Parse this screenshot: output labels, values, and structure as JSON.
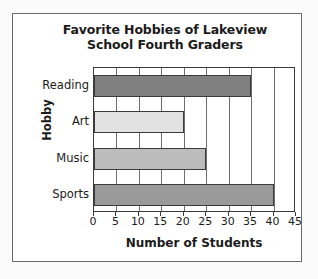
{
  "frame": {
    "background_color": "#fbfbfb",
    "border_color": "#6b6b6b",
    "plot_background": "#ffffff"
  },
  "chart_data": {
    "type": "bar",
    "orientation": "horizontal",
    "title": "Favorite Hobbies of Lakeview School Fourth Graders",
    "title_lines": [
      "Favorite Hobbies of Lakeview",
      "School Fourth Graders"
    ],
    "xlabel": "Number of Students",
    "ylabel": "Hobby",
    "categories": [
      "Reading",
      "Art",
      "Music",
      "Sports"
    ],
    "values": [
      35,
      20,
      25,
      40
    ],
    "bar_colors": [
      "#808080",
      "#e2e2e2",
      "#bcbcbc",
      "#9a9a9a"
    ],
    "bar_border_color": "#3b3b3b",
    "xlim": [
      0,
      45
    ],
    "xticks": [
      0,
      5,
      10,
      15,
      20,
      25,
      30,
      35,
      40,
      45
    ],
    "xtick_labels": [
      "0",
      "5",
      "10",
      "15",
      "20",
      "25",
      "30",
      "35",
      "40",
      "45"
    ],
    "grid": true,
    "grid_axis": "x",
    "grid_color": "#6f6f6f",
    "legend": false,
    "bars": [
      {
        "category": "Reading",
        "value": 35,
        "color": "#808080"
      },
      {
        "category": "Art",
        "value": 20,
        "color": "#e2e2e2"
      },
      {
        "category": "Music",
        "value": 25,
        "color": "#bcbcbc"
      },
      {
        "category": "Sports",
        "value": 40,
        "color": "#9a9a9a"
      }
    ]
  }
}
